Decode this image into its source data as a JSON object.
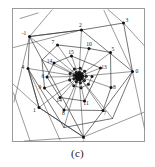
{
  "figure": {
    "caption": "(c)",
    "frame": {
      "x": 12.5,
      "y": 8.5,
      "width": 132,
      "height": 133,
      "stroke": "#9a9a9a",
      "fill": "#ffffff"
    },
    "colors": {
      "line": "#3a3a3a",
      "ray": "#555555",
      "vertex": "#111111",
      "label": "#1b1b1b",
      "frame": "#9a9a9a",
      "background": "#ffffff"
    },
    "style": {
      "vertex_radius": 1.5,
      "polygon_stroke_width": 0.7,
      "ray_stroke_width": 0.6,
      "label_font_size": 5.6
    }
  },
  "chart_data": {
    "type": "scatter",
    "title": "",
    "subtitle": "",
    "xlabel": "",
    "ylabel": "",
    "caption": "(c)",
    "grid": false,
    "legend": null,
    "axis_visible": false,
    "xlim": [
      12.5,
      144.5
    ],
    "ylim": [
      8.5,
      141.5
    ],
    "points": [
      {
        "label": "-1",
        "x": 29.5,
        "y": 36.5,
        "label_dx": -5.5,
        "label_dy": -1.5
      },
      {
        "label": "2",
        "x": 81.5,
        "y": 30.0,
        "label_dx": -1.0,
        "label_dy": -3.0
      },
      {
        "label": "3",
        "x": 123.5,
        "y": 23.0,
        "label_dx": 3.5,
        "label_dy": -1.5
      },
      {
        "label": "0",
        "x": 132.5,
        "y": 71.5,
        "label_dx": 4.5,
        "label_dy": 1.5
      },
      {
        "label": "7",
        "x": 83.5,
        "y": 137.0,
        "label_dx": 0.0,
        "label_dy": 4.5
      },
      {
        "label": "1",
        "x": 39.0,
        "y": 107.5,
        "label_dx": -4.5,
        "label_dy": 4.5
      },
      {
        "label": "4",
        "x": 28.0,
        "y": 68.5,
        "label_dx": -5.0,
        "label_dy": 0.5
      },
      {
        "label": "7b",
        "x": 57.5,
        "y": 45.0,
        "label_dx": -4.5,
        "label_dy": -1.5
      },
      {
        "label": "10",
        "x": 89.0,
        "y": 48.5,
        "label_dx": 0.0,
        "label_dy": -3.0
      },
      {
        "label": "5",
        "x": 110.5,
        "y": 52.5,
        "label_dx": 2.5,
        "label_dy": -1.5
      },
      {
        "label": "8",
        "x": 111.0,
        "y": 87.5,
        "label_dx": 3.5,
        "label_dy": 1.5
      },
      {
        "label": "7c",
        "x": 103.0,
        "y": 110.5,
        "label_dx": 2.0,
        "label_dy": 4.0
      },
      {
        "label": "8b",
        "x": 64.0,
        "y": 110.0,
        "label_dx": -0.5,
        "label_dy": 4.5
      },
      {
        "label": "9",
        "x": 44.5,
        "y": 88.0,
        "label_dx": -4.5,
        "label_dy": 1.0
      },
      {
        "label": "15",
        "x": 71.5,
        "y": 56.0,
        "label_dx": -0.5,
        "label_dy": -2.5
      },
      {
        "label": "14",
        "x": 54.0,
        "y": 63.0,
        "label_dx": -4.5,
        "label_dy": -0.5
      },
      {
        "label": "13",
        "x": 100.5,
        "y": 68.0,
        "label_dx": 3.5,
        "label_dy": 0.5
      },
      {
        "label": "11",
        "x": 84.5,
        "y": 101.0,
        "label_dx": 1.5,
        "label_dy": 4.0
      },
      {
        "label": "14b",
        "x": 60.0,
        "y": 97.5,
        "label_dx": -1.0,
        "label_dy": 4.5
      },
      {
        "label": "6",
        "x": 47.0,
        "y": 77.0,
        "label_dx": -4.0,
        "label_dy": 0.5
      }
    ],
    "vertex_labels": [
      "-1",
      "0",
      "1",
      "2",
      "3",
      "4",
      "5",
      "6",
      "7",
      "8",
      "9",
      "10",
      "11",
      "13",
      "14",
      "15"
    ],
    "outer_polygon": [
      [
        29.5,
        36.5
      ],
      [
        81.5,
        30.0
      ],
      [
        123.5,
        23.0
      ],
      [
        132.5,
        71.5
      ],
      [
        83.5,
        137.0
      ],
      [
        39.0,
        107.5
      ],
      [
        28.0,
        68.5
      ]
    ],
    "rings": [
      {
        "name": "ring-1",
        "vertices": [
          [
            29.5,
            36.5
          ],
          [
            81.5,
            30.0
          ],
          [
            132.5,
            71.5
          ],
          [
            112.5,
            118.5
          ],
          [
            64.0,
            127.5
          ],
          [
            28.0,
            68.5
          ],
          [
            39.0,
            107.5
          ],
          [
            83.5,
            137.0
          ]
        ]
      },
      {
        "name": "ring-2",
        "vertices": [
          [
            57.5,
            45.0
          ],
          [
            89.0,
            48.5
          ],
          [
            110.5,
            52.5
          ],
          [
            111.0,
            87.5
          ],
          [
            103.0,
            110.5
          ],
          [
            64.0,
            110.0
          ],
          [
            44.5,
            88.0
          ],
          [
            42.0,
            60.0
          ]
        ]
      },
      {
        "name": "ring-3",
        "vertices": [
          [
            71.5,
            56.0
          ],
          [
            100.5,
            68.0
          ],
          [
            84.5,
            101.0
          ],
          [
            60.0,
            97.5
          ],
          [
            47.0,
            77.0
          ],
          [
            54.0,
            63.0
          ]
        ]
      }
    ],
    "center_cluster": {
      "cx": 79.0,
      "cy": 76.5,
      "radius": 13.0,
      "point_count": 34
    },
    "rays": [
      {
        "from": [
          29.5,
          36.5
        ],
        "to": [
          14.0,
          102.0
        ]
      },
      {
        "from": [
          29.5,
          36.5
        ],
        "to": [
          52.0,
          10.0
        ]
      },
      {
        "from": [
          81.5,
          30.0
        ],
        "to": [
          13.5,
          47.5
        ]
      },
      {
        "from": [
          123.5,
          23.0
        ],
        "to": [
          145.0,
          46.5
        ]
      },
      {
        "from": [
          123.5,
          23.0
        ],
        "to": [
          108.0,
          9.5
        ]
      },
      {
        "from": [
          132.5,
          71.5
        ],
        "to": [
          144.5,
          128.5
        ]
      },
      {
        "from": [
          132.5,
          71.5
        ],
        "to": [
          104.0,
          10.5
        ]
      },
      {
        "from": [
          83.5,
          137.0
        ],
        "to": [
          144.5,
          112.0
        ]
      },
      {
        "from": [
          83.5,
          137.0
        ],
        "to": [
          24.5,
          141.0
        ]
      },
      {
        "from": [
          39.0,
          107.5
        ],
        "to": [
          13.0,
          84.0
        ]
      },
      {
        "from": [
          28.0,
          68.5
        ],
        "to": [
          60.0,
          140.0
        ]
      },
      {
        "from": [
          20.0,
          18.5
        ],
        "to": [
          38.0,
          13.0
        ]
      },
      {
        "from": [
          13.5,
          93.0
        ],
        "to": [
          30.0,
          140.5
        ]
      }
    ]
  }
}
